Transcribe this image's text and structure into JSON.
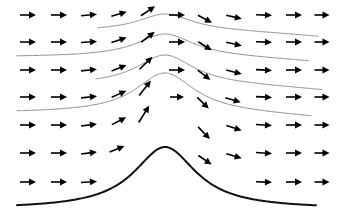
{
  "figure": {
    "background_color": "#ffffff",
    "width": 343,
    "height": 213
  },
  "chart_data": {
    "type": "line",
    "subtitle": "",
    "xlabel": "",
    "ylabel": "",
    "xlim": [
      0,
      343
    ],
    "ylim": [
      213,
      0
    ],
    "grid": false,
    "legend_position": "none",
    "annotations": [],
    "tick_labels": {
      "x": [],
      "y": []
    },
    "style": {
      "streamline_color": "#8c8c8c",
      "streamline_width": 1.0,
      "terrain_color": "#111111",
      "terrain_width": 2.0,
      "arrow_color": "#000000",
      "arrow_shaft_width": 1.6,
      "arrow_length": 16,
      "arrow_head_length": 7,
      "arrow_head_halfwidth": 3.4
    },
    "mountain": {
      "shape": "witch-of-agnesi",
      "peak_x": 165,
      "half_width": 38,
      "base_y": 209,
      "amplitude": 62
    },
    "series": [
      {
        "name": "streamline-1",
        "role": "streamline",
        "color": "#8c8c8c",
        "x_start": 98,
        "x_end": 318,
        "base_y": 31,
        "amplitude": 17,
        "half_width": 33,
        "peak_x": 165,
        "downstream_tilt": 6
      },
      {
        "name": "streamline-2",
        "role": "streamline",
        "color": "#8c8c8c",
        "x_start": 17,
        "x_end": 308,
        "base_y": 57,
        "amplitude": 23,
        "half_width": 35,
        "peak_x": 165,
        "downstream_tilt": 5
      },
      {
        "name": "streamline-3",
        "role": "streamline",
        "color": "#8c8c8c",
        "x_start": 96,
        "x_end": 322,
        "base_y": 85,
        "amplitude": 30,
        "half_width": 35,
        "peak_x": 165,
        "downstream_tilt": 6
      },
      {
        "name": "streamline-4",
        "role": "streamline",
        "color": "#8c8c8c",
        "x_start": 17,
        "x_end": 311,
        "base_y": 113,
        "amplitude": 40,
        "half_width": 36,
        "peak_x": 165,
        "downstream_tilt": 5
      },
      {
        "name": "terrain-mountain",
        "role": "terrain",
        "color": "#111111",
        "x_start": 17,
        "x_end": 316,
        "base_y": 209,
        "amplitude": 62,
        "half_width": 38,
        "peak_x": 165,
        "downstream_tilt": 0
      }
    ],
    "vector_rows": [
      {
        "row": 1,
        "base_y": 15,
        "vectors": [
          {
            "x": 28,
            "y": 15,
            "angle_deg": 0,
            "length": 16
          },
          {
            "x": 59,
            "y": 15,
            "angle_deg": 0,
            "length": 16
          },
          {
            "x": 89,
            "y": 15,
            "angle_deg": -5,
            "length": 16
          },
          {
            "x": 119,
            "y": 14,
            "angle_deg": -17,
            "length": 16
          },
          {
            "x": 148,
            "y": 11,
            "angle_deg": -34,
            "length": 17
          },
          {
            "x": 177,
            "y": 15,
            "angle_deg": 0,
            "length": 16
          },
          {
            "x": 205,
            "y": 19,
            "angle_deg": 28,
            "length": 16
          },
          {
            "x": 234,
            "y": 17,
            "angle_deg": 13,
            "length": 16
          },
          {
            "x": 264,
            "y": 15,
            "angle_deg": 2,
            "length": 16
          },
          {
            "x": 294,
            "y": 15,
            "angle_deg": 0,
            "length": 16
          },
          {
            "x": 322,
            "y": 15,
            "angle_deg": 0,
            "length": 15
          }
        ]
      },
      {
        "row": 2,
        "base_y": 42,
        "vectors": [
          {
            "x": 28,
            "y": 42,
            "angle_deg": 0,
            "length": 16
          },
          {
            "x": 59,
            "y": 42,
            "angle_deg": 0,
            "length": 16
          },
          {
            "x": 89,
            "y": 42,
            "angle_deg": -4,
            "length": 16
          },
          {
            "x": 119,
            "y": 40,
            "angle_deg": -18,
            "length": 16
          },
          {
            "x": 148,
            "y": 37,
            "angle_deg": -38,
            "length": 17
          },
          {
            "x": 177,
            "y": 42,
            "angle_deg": 0,
            "length": 16
          },
          {
            "x": 205,
            "y": 46,
            "angle_deg": 32,
            "length": 16
          },
          {
            "x": 234,
            "y": 44,
            "angle_deg": 12,
            "length": 16
          },
          {
            "x": 264,
            "y": 42,
            "angle_deg": 2,
            "length": 16
          },
          {
            "x": 294,
            "y": 42,
            "angle_deg": 0,
            "length": 16
          },
          {
            "x": 322,
            "y": 42,
            "angle_deg": 0,
            "length": 15
          }
        ]
      },
      {
        "row": 3,
        "base_y": 70,
        "vectors": [
          {
            "x": 28,
            "y": 70,
            "angle_deg": 0,
            "length": 16
          },
          {
            "x": 59,
            "y": 70,
            "angle_deg": 0,
            "length": 16
          },
          {
            "x": 89,
            "y": 70,
            "angle_deg": -6,
            "length": 16
          },
          {
            "x": 119,
            "y": 68,
            "angle_deg": -22,
            "length": 16
          },
          {
            "x": 146,
            "y": 63,
            "angle_deg": -44,
            "length": 18
          },
          {
            "x": 177,
            "y": 70,
            "angle_deg": 0,
            "length": 16
          },
          {
            "x": 204,
            "y": 75,
            "angle_deg": 38,
            "length": 16
          },
          {
            "x": 234,
            "y": 72,
            "angle_deg": 14,
            "length": 16
          },
          {
            "x": 264,
            "y": 70,
            "angle_deg": 3,
            "length": 16
          },
          {
            "x": 294,
            "y": 70,
            "angle_deg": 0,
            "length": 16
          },
          {
            "x": 322,
            "y": 70,
            "angle_deg": 0,
            "length": 15
          }
        ]
      },
      {
        "row": 4,
        "base_y": 97,
        "vectors": [
          {
            "x": 28,
            "y": 97,
            "angle_deg": 0,
            "length": 16
          },
          {
            "x": 59,
            "y": 97,
            "angle_deg": 0,
            "length": 16
          },
          {
            "x": 89,
            "y": 97,
            "angle_deg": -6,
            "length": 16
          },
          {
            "x": 119,
            "y": 94,
            "angle_deg": -24,
            "length": 16
          },
          {
            "x": 145,
            "y": 88,
            "angle_deg": -52,
            "length": 19
          },
          {
            "x": 177,
            "y": 97,
            "angle_deg": 0,
            "length": 14
          },
          {
            "x": 203,
            "y": 103,
            "angle_deg": 44,
            "length": 16
          },
          {
            "x": 233,
            "y": 100,
            "angle_deg": 16,
            "length": 16
          },
          {
            "x": 264,
            "y": 97,
            "angle_deg": 3,
            "length": 16
          },
          {
            "x": 294,
            "y": 97,
            "angle_deg": 0,
            "length": 16
          },
          {
            "x": 322,
            "y": 97,
            "angle_deg": 0,
            "length": 15
          }
        ]
      },
      {
        "row": 5,
        "base_y": 125,
        "vectors": [
          {
            "x": 28,
            "y": 125,
            "angle_deg": 0,
            "length": 16
          },
          {
            "x": 59,
            "y": 125,
            "angle_deg": 0,
            "length": 16
          },
          {
            "x": 89,
            "y": 125,
            "angle_deg": -7,
            "length": 16
          },
          {
            "x": 119,
            "y": 121,
            "angle_deg": -27,
            "length": 16
          },
          {
            "x": 144,
            "y": 114,
            "angle_deg": -58,
            "length": 20
          },
          {
            "x": 204,
            "y": 133,
            "angle_deg": 46,
            "length": 17
          },
          {
            "x": 234,
            "y": 128,
            "angle_deg": 18,
            "length": 16
          },
          {
            "x": 264,
            "y": 125,
            "angle_deg": 4,
            "length": 16
          },
          {
            "x": 294,
            "y": 125,
            "angle_deg": 0,
            "length": 16
          },
          {
            "x": 322,
            "y": 125,
            "angle_deg": 0,
            "length": 15
          }
        ]
      },
      {
        "row": 6,
        "base_y": 153,
        "vectors": [
          {
            "x": 28,
            "y": 153,
            "angle_deg": 0,
            "length": 16
          },
          {
            "x": 59,
            "y": 153,
            "angle_deg": 0,
            "length": 16
          },
          {
            "x": 89,
            "y": 153,
            "angle_deg": -7,
            "length": 16
          },
          {
            "x": 117,
            "y": 149,
            "angle_deg": -22,
            "length": 16
          },
          {
            "x": 205,
            "y": 160,
            "angle_deg": 34,
            "length": 16
          },
          {
            "x": 234,
            "y": 156,
            "angle_deg": 16,
            "length": 16
          },
          {
            "x": 264,
            "y": 153,
            "angle_deg": 4,
            "length": 16
          },
          {
            "x": 294,
            "y": 153,
            "angle_deg": 0,
            "length": 16
          },
          {
            "x": 322,
            "y": 153,
            "angle_deg": 0,
            "length": 15
          }
        ]
      },
      {
        "row": 7,
        "base_y": 182,
        "vectors": [
          {
            "x": 28,
            "y": 182,
            "angle_deg": 0,
            "length": 16
          },
          {
            "x": 59,
            "y": 182,
            "angle_deg": 0,
            "length": 16
          },
          {
            "x": 89,
            "y": 182,
            "angle_deg": -4,
            "length": 16
          },
          {
            "x": 264,
            "y": 182,
            "angle_deg": 2,
            "length": 16
          },
          {
            "x": 294,
            "y": 182,
            "angle_deg": 0,
            "length": 16
          },
          {
            "x": 322,
            "y": 182,
            "angle_deg": 0,
            "length": 15
          }
        ]
      }
    ]
  }
}
